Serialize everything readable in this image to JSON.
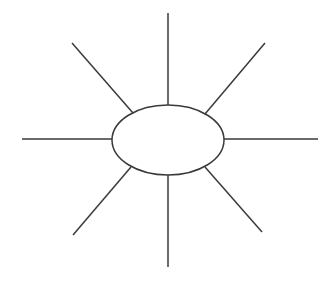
{
  "canvas": {
    "width": 335,
    "height": 281,
    "background_color": "#ffffff",
    "title": "Sun Diagram Graphic Organizer"
  },
  "style": {
    "stroke_color": "#3a3a3a",
    "stroke_width": 1.5,
    "shape_fill_color": "#ffffff"
  },
  "center_shape": {
    "type": "ellipse",
    "label": "",
    "cx": 168,
    "cy": 140,
    "rx": 56,
    "ry": 35
  },
  "rays": [
    {
      "name": "north",
      "label": "",
      "direction": "N",
      "x1": 168,
      "y1": 105,
      "x2": 168,
      "y2": 13
    },
    {
      "name": "northeast",
      "label": "",
      "direction": "NE",
      "x1": 205,
      "y1": 114,
      "x2": 265,
      "y2": 43
    },
    {
      "name": "east",
      "label": "",
      "direction": "E",
      "x1": 224,
      "y1": 139,
      "x2": 318,
      "y2": 139
    },
    {
      "name": "southeast",
      "label": "",
      "direction": "SE",
      "x1": 205,
      "y1": 167,
      "x2": 262,
      "y2": 232
    },
    {
      "name": "south",
      "label": "",
      "direction": "S",
      "x1": 168,
      "y1": 175,
      "x2": 168,
      "y2": 267
    },
    {
      "name": "southwest",
      "label": "",
      "direction": "SW",
      "x1": 131,
      "y1": 167,
      "x2": 73,
      "y2": 235
    },
    {
      "name": "west",
      "label": "",
      "direction": "W",
      "x1": 112,
      "y1": 139,
      "x2": 22,
      "y2": 139
    },
    {
      "name": "northwest",
      "label": "",
      "direction": "NW",
      "x1": 133,
      "y1": 113,
      "x2": 72,
      "y2": 43
    }
  ],
  "ray_count": 8,
  "artifacts": {
    "ghost_text_left": "",
    "ghost_text_right": ""
  }
}
